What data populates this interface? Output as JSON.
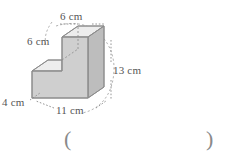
{
  "figure": {
    "shape_type": "composite rectangular prism (L-shape / step solid)",
    "units": "cm",
    "fill_front": "#cfcfcf",
    "fill_top": "#ededed",
    "fill_side": "#bdbdbd",
    "stroke": "#8c8c8c",
    "dash_stroke": "#9a9a9a",
    "dimensions": {
      "top_width": "6 cm",
      "step_depth": "6 cm",
      "right_height": "13 cm",
      "bottom_left_height": "4 cm",
      "bottom_width": "11 cm"
    }
  },
  "answer": {
    "open_paren": "(",
    "close_paren": ")",
    "value": ""
  }
}
